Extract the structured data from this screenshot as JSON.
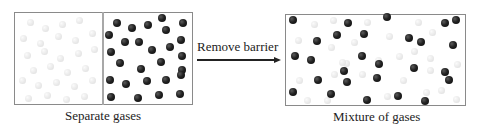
{
  "left_panel": {
    "caption": "Separate gases",
    "box": {
      "x": 14,
      "y": 12,
      "w": 179,
      "h": 93
    },
    "divider_x": 103,
    "gas_a_color": "#dcdcdc",
    "gas_b_color": "#1a1a1a"
  },
  "arrow": {
    "label": "Remove barrier",
    "x1": 197,
    "x2": 281,
    "y": 59
  },
  "right_panel": {
    "caption": "Mixture of gases",
    "box": {
      "x": 285,
      "y": 14,
      "w": 181,
      "h": 92
    }
  },
  "particles": {
    "left_light": [
      [
        30,
        22
      ],
      [
        45,
        28
      ],
      [
        62,
        24
      ],
      [
        79,
        20
      ],
      [
        23,
        38
      ],
      [
        40,
        43
      ],
      [
        58,
        36
      ],
      [
        75,
        40
      ],
      [
        92,
        33
      ],
      [
        27,
        55
      ],
      [
        44,
        51
      ],
      [
        60,
        58
      ],
      [
        78,
        53
      ],
      [
        94,
        49
      ],
      [
        33,
        70
      ],
      [
        50,
        66
      ],
      [
        67,
        72
      ],
      [
        85,
        68
      ],
      [
        22,
        80
      ],
      [
        38,
        85
      ],
      [
        56,
        82
      ],
      [
        74,
        86
      ],
      [
        92,
        80
      ],
      [
        28,
        98
      ],
      [
        47,
        95
      ],
      [
        66,
        99
      ],
      [
        84,
        96
      ]
    ],
    "left_dark": [
      [
        117,
        23
      ],
      [
        132,
        28
      ],
      [
        148,
        25
      ],
      [
        162,
        18
      ],
      [
        183,
        23
      ],
      [
        109,
        35
      ],
      [
        125,
        42
      ],
      [
        166,
        30
      ],
      [
        181,
        40
      ],
      [
        111,
        52
      ],
      [
        139,
        42
      ],
      [
        152,
        50
      ],
      [
        170,
        47
      ],
      [
        182,
        56
      ],
      [
        120,
        63
      ],
      [
        141,
        69
      ],
      [
        161,
        62
      ],
      [
        182,
        70
      ],
      [
        110,
        80
      ],
      [
        126,
        84
      ],
      [
        147,
        81
      ],
      [
        166,
        80
      ],
      [
        181,
        75
      ],
      [
        111,
        97
      ],
      [
        138,
        98
      ],
      [
        159,
        95
      ],
      [
        180,
        94
      ]
    ],
    "right_light": [
      [
        314,
        24
      ],
      [
        333,
        20
      ],
      [
        367,
        22
      ],
      [
        418,
        22
      ],
      [
        298,
        40
      ],
      [
        331,
        47
      ],
      [
        354,
        42
      ],
      [
        389,
        36
      ],
      [
        432,
        32
      ],
      [
        399,
        56
      ],
      [
        346,
        63
      ],
      [
        430,
        58
      ],
      [
        334,
        74
      ],
      [
        362,
        74
      ],
      [
        403,
        80
      ],
      [
        457,
        64
      ],
      [
        299,
        80
      ],
      [
        327,
        100
      ],
      [
        307,
        100
      ],
      [
        387,
        96
      ],
      [
        426,
        92
      ],
      [
        441,
        90
      ],
      [
        456,
        99
      ],
      [
        378,
        60
      ],
      [
        342,
        62
      ],
      [
        414,
        51
      ],
      [
        430,
        70
      ]
    ],
    "right_dark": [
      [
        293,
        20
      ],
      [
        348,
        23
      ],
      [
        387,
        17
      ],
      [
        445,
        23
      ],
      [
        456,
        20
      ],
      [
        337,
        35
      ],
      [
        364,
        34
      ],
      [
        317,
        41
      ],
      [
        409,
        38
      ],
      [
        421,
        42
      ],
      [
        453,
        45
      ],
      [
        295,
        56
      ],
      [
        311,
        60
      ],
      [
        362,
        56
      ],
      [
        379,
        64
      ],
      [
        414,
        68
      ],
      [
        445,
        72
      ],
      [
        318,
        80
      ],
      [
        347,
        82
      ],
      [
        344,
        71
      ],
      [
        377,
        78
      ],
      [
        293,
        92
      ],
      [
        331,
        94
      ],
      [
        367,
        100
      ],
      [
        398,
        96
      ],
      [
        425,
        101
      ],
      [
        449,
        80
      ]
    ]
  }
}
